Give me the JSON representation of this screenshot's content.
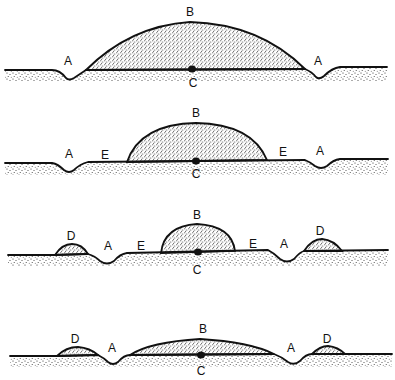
{
  "diagram": {
    "type": "cross-section stages",
    "colors": {
      "ink": "#111111",
      "background": "#ffffff",
      "stipple": "#222222"
    },
    "panels": [
      {
        "id": "stage-1",
        "labels": [
          {
            "text": "A",
            "x": 68,
            "y": 65
          },
          {
            "text": "B",
            "x": 190,
            "y": 16
          },
          {
            "text": "A",
            "x": 318,
            "y": 65
          },
          {
            "text": "C",
            "x": 193,
            "y": 87
          }
        ],
        "ground_path": "M5,70 L52,70 Q60,70 66,78 Q69,81 74,78 L86,70 L305,69 Q312,72 316,77 Q319,80 324,76 Q332,68 340,67 L387,67",
        "mound_path": "M86,70 Q130,26 190,22 Q260,24 305,69 Z",
        "soil_path": "M5,70 L52,70 Q60,70 66,78 Q69,81 74,78 L86,70 L305,69 Q312,72 316,77 Q319,80 324,76 Q332,68 340,67 L387,67 L387,82 L5,82 Z",
        "dot": {
          "x": 192,
          "y": 69
        }
      },
      {
        "id": "stage-2",
        "labels": [
          {
            "text": "A",
            "x": 69,
            "y": 158
          },
          {
            "text": "E",
            "x": 105,
            "y": 159
          },
          {
            "text": "B",
            "x": 196,
            "y": 117
          },
          {
            "text": "E",
            "x": 283,
            "y": 156
          },
          {
            "text": "A",
            "x": 320,
            "y": 155
          },
          {
            "text": "C",
            "x": 196,
            "y": 178
          }
        ],
        "ground_path": "M5,163 L52,163 Q58,164 64,170 Q69,174 74,170 Q80,164 88,162 L305,160 Q310,162 315,166 Q321,170 327,166 Q333,160 340,159 L388,159",
        "mound_path": "M127,162 Q140,124 196,123 Q252,124 267,160 Z",
        "soil_path": "M5,163 L52,163 Q58,164 64,170 Q69,174 74,170 Q80,164 88,162 L305,160 Q310,162 315,166 Q321,170 327,166 Q333,160 340,159 L388,159 L388,175 L5,175 Z",
        "dot": {
          "x": 196,
          "y": 161
        }
      },
      {
        "id": "stage-3",
        "labels": [
          {
            "text": "D",
            "x": 71,
            "y": 240
          },
          {
            "text": "A",
            "x": 108,
            "y": 250
          },
          {
            "text": "E",
            "x": 141,
            "y": 250
          },
          {
            "text": "B",
            "x": 197,
            "y": 219
          },
          {
            "text": "E",
            "x": 253,
            "y": 248
          },
          {
            "text": "A",
            "x": 284,
            "y": 248
          },
          {
            "text": "D",
            "x": 320,
            "y": 235
          },
          {
            "text": "C",
            "x": 197,
            "y": 274
          }
        ],
        "ground_path": "M8,255 L55,255 L88,254 Q95,256 100,261 Q107,266 114,261 Q120,254 127,253 L268,250 Q274,253 280,259 Q287,264 294,259 Q300,252 304,251 L388,250",
        "mound_paths": [
          "M55,255 Q62,244 72,244 Q82,244 88,254 Z",
          "M161,253 Q164,226 197,224 Q232,226 235,251 Z",
          "M304,251 Q312,239 322,239 Q334,240 342,251 Z"
        ],
        "soil_path": "M8,255 L55,255 L88,254 Q95,256 100,261 Q107,266 114,261 Q120,254 127,253 L268,250 Q274,253 280,259 Q287,264 294,259 Q300,252 304,251 L388,250 L388,266 L8,266 Z",
        "dot": {
          "x": 198,
          "y": 252
        }
      },
      {
        "id": "stage-4",
        "labels": [
          {
            "text": "D",
            "x": 75,
            "y": 343
          },
          {
            "text": "A",
            "x": 112,
            "y": 352
          },
          {
            "text": "B",
            "x": 203,
            "y": 333
          },
          {
            "text": "A",
            "x": 291,
            "y": 352
          },
          {
            "text": "D",
            "x": 327,
            "y": 343
          },
          {
            "text": "C",
            "x": 201,
            "y": 375
          }
        ],
        "ground_path": "M10,356 L57,356 L98,355 Q104,358 108,362 Q113,366 118,362 Q124,355 130,355 L274,354 Q282,357 288,362 Q294,366 300,361 Q306,354 312,354 L392,354",
        "mound_paths": [
          "M57,356 Q66,347 78,347 Q90,348 98,355 Z",
          "M130,355 Q150,342 200,339 Q250,342 274,354 Z",
          "M312,354 Q320,346 328,346 Q338,347 345,354 Z"
        ],
        "soil_path": "M10,356 L57,356 L98,355 Q104,358 108,362 Q113,366 118,362 Q124,355 130,355 L274,354 Q282,357 288,362 Q294,366 300,361 Q306,354 312,354 L392,354 L392,367 L10,367 Z",
        "dot": {
          "x": 201,
          "y": 355
        }
      }
    ]
  }
}
